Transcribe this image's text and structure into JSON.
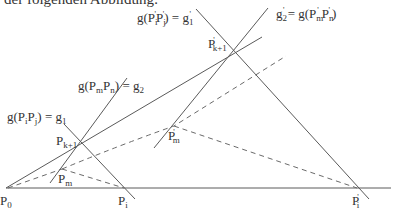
{
  "caption": "der folgenden Abbildung:",
  "labels": {
    "g1_prime_eq": {
      "lhs": "g(P",
      "i": "i",
      "j": "j",
      "rhs": "g",
      "sub": "1"
    },
    "g2_prime_eq": {
      "lhs": "g",
      "sub": "2",
      "rhs": "= g(P",
      "m": "m",
      "n": "n"
    },
    "g2_eq": {
      "text": "g(P",
      "m": "m",
      "n": "n",
      "rhs": "g",
      "sub": "2"
    },
    "g1_eq": {
      "text": "g(P",
      "i": "i",
      "j": "j",
      "rhs": "g",
      "sub": "1"
    },
    "P0": {
      "base": "P",
      "sub": "0"
    },
    "Pi": {
      "base": "P",
      "sub": "i"
    },
    "Pi_prime": {
      "base": "P",
      "sub": "i"
    },
    "Pk1": {
      "base": "P",
      "sub": "k+1"
    },
    "Pk1_prime": {
      "base": "P",
      "sub": "k+1"
    },
    "Pm": {
      "base": "P",
      "sub": "m"
    },
    "Pm_prime": {
      "base": "P",
      "sub": "m"
    }
  },
  "points": [
    "P0",
    "Pi",
    "Pi'",
    "Pk+1",
    "P'k+1",
    "Pm",
    "P'm"
  ],
  "lines": [
    "g1 = g(PiPj)",
    "g2 = g(PmPn)",
    "g1' = g(Pi'Pj')",
    "g2' = g(Pm'Pn')"
  ]
}
